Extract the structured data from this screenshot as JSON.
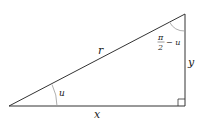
{
  "diagram": {
    "type": "right-triangle",
    "colors": {
      "stroke": "#333333",
      "arc": "#999999",
      "text": "#222222",
      "background": "#ffffff"
    },
    "labels": {
      "hypotenuse": "r",
      "base": "x",
      "height": "y",
      "angle_bottom_left": "u",
      "angle_top_numerator": "π",
      "angle_top_denominator": "2",
      "angle_top_suffix": "− u"
    },
    "vertices": {
      "bottom_left": [
        9,
        106
      ],
      "bottom_right": [
        185,
        106
      ],
      "top_right": [
        185,
        14
      ]
    },
    "right_angle_marker": "bottom_right"
  }
}
